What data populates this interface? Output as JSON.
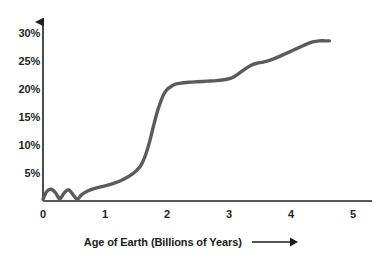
{
  "chart_data": {
    "type": "line",
    "title": "",
    "subtitle": "",
    "xlabel": "Age of Earth (Billions of Years)",
    "ylabel": "",
    "xlim": [
      0,
      5.25
    ],
    "ylim": [
      0,
      32
    ],
    "grid": false,
    "legend": null,
    "line_color": "#5b5b5b",
    "axis_color": "#231f20",
    "text_color": "#221f1f",
    "background": "#ffffff",
    "x_ticks": [
      0,
      1,
      2,
      3,
      4,
      5
    ],
    "x_tick_labels": [
      "0",
      "1",
      "2",
      "3",
      "4",
      "5"
    ],
    "y_ticks": [
      5,
      10,
      15,
      20,
      25,
      30
    ],
    "y_tick_labels": [
      "5%",
      "10%",
      "15%",
      "20%",
      "25%",
      "30%"
    ],
    "x_axis_arrow": true,
    "y_axis_arrow": true,
    "xlabel_arrow": true,
    "series": [
      {
        "name": "Atmospheric oxygen",
        "x": [
          0.0,
          0.06,
          0.13,
          0.2,
          0.27,
          0.34,
          0.41,
          0.48,
          0.55,
          0.62,
          0.72,
          0.85,
          1.0,
          1.15,
          1.3,
          1.45,
          1.57,
          1.65,
          1.72,
          1.78,
          1.84,
          1.9,
          1.95,
          2.0,
          2.06,
          2.12,
          2.2,
          2.35,
          2.5,
          2.65,
          2.8,
          2.95,
          3.05,
          3.15,
          3.25,
          3.35,
          3.45,
          3.55,
          3.65,
          3.75,
          3.85,
          3.95,
          4.05,
          4.15,
          4.25,
          4.35,
          4.45,
          4.55,
          4.62
        ],
        "y": [
          0.3,
          1.7,
          2.1,
          1.5,
          0.4,
          1.4,
          2.0,
          1.2,
          0.3,
          1.1,
          1.8,
          2.3,
          2.7,
          3.2,
          3.9,
          4.9,
          6.2,
          8.1,
          10.6,
          13.3,
          15.8,
          17.8,
          19.1,
          19.9,
          20.4,
          20.8,
          21.0,
          21.2,
          21.3,
          21.4,
          21.5,
          21.7,
          22.0,
          22.7,
          23.5,
          24.2,
          24.6,
          24.8,
          25.1,
          25.5,
          26.0,
          26.5,
          27.0,
          27.5,
          28.0,
          28.4,
          28.6,
          28.6,
          28.6
        ]
      }
    ]
  },
  "axes": {
    "x_axis_name": "x-axis",
    "y_axis_name": "y-axis"
  }
}
